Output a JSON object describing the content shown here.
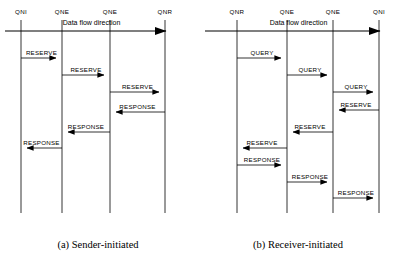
{
  "figure": {
    "width": 397,
    "height": 265,
    "background": "#ffffff",
    "line_color": "#000000"
  },
  "panels": [
    {
      "id": "a",
      "caption": "(a) Sender-initiated",
      "flow_label": "Data flow direction",
      "flow_arrow": {
        "x1": 5,
        "x2": 178,
        "y": 31,
        "direction": "right"
      },
      "lifelines": [
        {
          "label": "QNI",
          "x": 21,
          "y_top": 20,
          "y_bottom": 213
        },
        {
          "label": "QNE",
          "x": 62,
          "y_top": 20,
          "y_bottom": 213
        },
        {
          "label": "QNE",
          "x": 110,
          "y_top": 20,
          "y_bottom": 213
        },
        {
          "label": "QNR",
          "x": 165,
          "y_top": 20,
          "y_bottom": 213
        }
      ],
      "label_y": 12,
      "messages": [
        {
          "label": "RESERVE",
          "from": 0,
          "to": 1,
          "y": 58,
          "direction": "right"
        },
        {
          "label": "RESERVE",
          "from": 1,
          "to": 2,
          "y": 75,
          "direction": "right"
        },
        {
          "label": "RESERVE",
          "from": 2,
          "to": 3,
          "y": 92,
          "direction": "right"
        },
        {
          "label": "RESPONSE",
          "from": 3,
          "to": 2,
          "y": 112,
          "direction": "left"
        },
        {
          "label": "RESPONSE",
          "from": 2,
          "to": 1,
          "y": 132,
          "direction": "left"
        },
        {
          "label": "RESPONSE",
          "from": 1,
          "to": 0,
          "y": 148,
          "direction": "left"
        }
      ]
    },
    {
      "id": "b",
      "caption": "(b) Receiver-initiated",
      "flow_label": "Data flow direction",
      "flow_arrow": {
        "x1": 5,
        "x2": 192,
        "y": 31,
        "direction": "right"
      },
      "lifelines": [
        {
          "label": "QNR",
          "x": 37,
          "y_top": 20,
          "y_bottom": 213
        },
        {
          "label": "QNE",
          "x": 87,
          "y_top": 20,
          "y_bottom": 213
        },
        {
          "label": "QNE",
          "x": 133,
          "y_top": 20,
          "y_bottom": 213
        },
        {
          "label": "QNI",
          "x": 179,
          "y_top": 20,
          "y_bottom": 213
        }
      ],
      "label_y": 12,
      "messages": [
        {
          "label": "QUERY",
          "from": 0,
          "to": 1,
          "y": 58,
          "direction": "right"
        },
        {
          "label": "QUERY",
          "from": 1,
          "to": 2,
          "y": 75,
          "direction": "right"
        },
        {
          "label": "QUERY",
          "from": 2,
          "to": 3,
          "y": 92,
          "direction": "right"
        },
        {
          "label": "RESERVE",
          "from": 3,
          "to": 2,
          "y": 110,
          "direction": "left"
        },
        {
          "label": "RESERVE",
          "from": 2,
          "to": 1,
          "y": 132,
          "direction": "left"
        },
        {
          "label": "RESERVE",
          "from": 1,
          "to": 0,
          "y": 148,
          "direction": "left"
        },
        {
          "label": "RESPONSE",
          "from": 0,
          "to": 1,
          "y": 165,
          "direction": "right"
        },
        {
          "label": "RESPONSE",
          "from": 1,
          "to": 2,
          "y": 182,
          "direction": "right"
        },
        {
          "label": "RESPONSE",
          "from": 2,
          "to": 3,
          "y": 198,
          "direction": "right"
        }
      ]
    }
  ]
}
